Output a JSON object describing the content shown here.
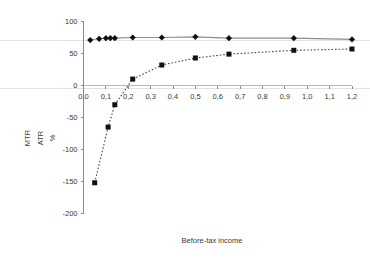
{
  "chart_data": {
    "type": "line",
    "title": "",
    "subtitle": "",
    "xlabel": "Before-tax income",
    "ylabel": "MTR ATR %",
    "ylabel_parts": [
      "MTR",
      "ATR",
      "%"
    ],
    "xlim": [
      0.0,
      1.2
    ],
    "ylim": [
      -200,
      100
    ],
    "grid": false,
    "legend": "none",
    "decimal_separator": ",",
    "xticks": [
      0.0,
      0.1,
      0.2,
      0.3,
      0.4,
      0.5,
      0.6,
      0.7,
      0.8,
      0.9,
      1.0,
      1.1,
      1.2
    ],
    "xtick_labels": [
      "0,0",
      "0,1",
      "0,2",
      "0,3",
      "0,4",
      "0,5",
      "0,6",
      "0,7",
      "0,8",
      "0,9",
      "1,0",
      "1,1",
      "1,2"
    ],
    "yticks": [
      100,
      50,
      0,
      -50,
      -100,
      -150,
      -200
    ],
    "ytick_labels": [
      "100",
      "50",
      "0",
      "-50",
      "-100",
      "-150",
      "-200"
    ],
    "series": [
      {
        "name": "MTR",
        "marker": "diamond",
        "linestyle": "solid",
        "color": "#8c8c8c",
        "marker_color": "#111111",
        "x": [
          0.03,
          0.07,
          0.1,
          0.12,
          0.14,
          0.22,
          0.35,
          0.5,
          0.65,
          0.94,
          1.2
        ],
        "y": [
          71,
          73,
          74,
          74,
          74,
          75,
          75,
          76,
          74,
          74,
          72
        ]
      },
      {
        "name": "ATR",
        "marker": "square",
        "linestyle": "dotted",
        "color": "#4a4a4a",
        "marker_color": "#111111",
        "x": [
          0.05,
          0.11,
          0.14,
          0.22,
          0.35,
          0.5,
          0.65,
          0.94,
          1.2
        ],
        "y": [
          -152,
          -65,
          -30,
          10,
          32,
          43,
          49,
          55,
          57
        ]
      }
    ]
  },
  "axes": {
    "x_title": "Before-tax income",
    "y_title_line1": "MTR",
    "y_title_line2": "ATR",
    "y_title_line3": "%"
  }
}
